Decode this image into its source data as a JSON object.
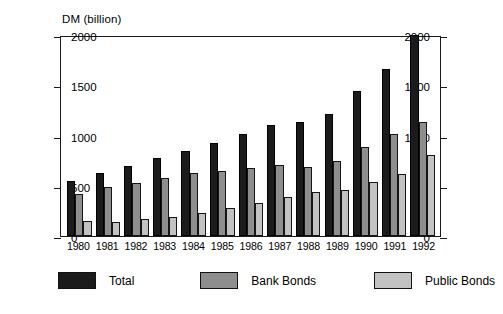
{
  "chart_data": {
    "type": "bar",
    "title": "",
    "subtitle": "",
    "xlabel": "",
    "ylabel": "DM (billion)",
    "ylim": [
      0,
      2000
    ],
    "ytick_values": [
      0,
      500,
      1000,
      1500,
      2000
    ],
    "ytick_labels": [
      "0",
      "500",
      "1000",
      "1500",
      "2000"
    ],
    "right_axis": true,
    "right_ytick_labels": [
      "0",
      "500",
      "1000",
      "1500",
      "2000"
    ],
    "grid": false,
    "legend_position": "below",
    "categories": [
      "1980",
      "1981",
      "1982",
      "1983",
      "1984",
      "1985",
      "1986",
      "1987",
      "1988",
      "1989",
      "1990",
      "1991",
      "1992"
    ],
    "series": [
      {
        "name": "Total",
        "color": "#1b1b1b",
        "values": [
          545,
          625,
          695,
          775,
          850,
          930,
          1015,
          1100,
          1135,
          1215,
          1445,
          1665,
          2000
        ]
      },
      {
        "name": "Bank Bonds",
        "color": "#8e8e8e",
        "values": [
          420,
          490,
          530,
          580,
          625,
          650,
          675,
          705,
          690,
          745,
          885,
          1020,
          1135
        ]
      },
      {
        "name": "Public Bonds",
        "color": "#c2c2c2",
        "values": [
          145,
          140,
          165,
          190,
          225,
          275,
          325,
          385,
          435,
          455,
          535,
          620,
          810
        ]
      }
    ]
  },
  "legend": [
    {
      "label": "Total",
      "swatch": "total"
    },
    {
      "label": "Bank Bonds",
      "swatch": "bank"
    },
    {
      "label": "Public Bonds",
      "swatch": "public"
    }
  ]
}
